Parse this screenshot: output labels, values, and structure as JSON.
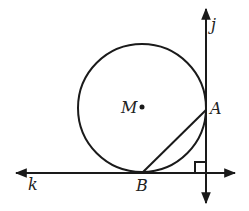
{
  "diagram": {
    "type": "geometry",
    "labels": {
      "center": "M",
      "point_a": "A",
      "point_b": "B",
      "line_vertical": "j",
      "line_horizontal": "k"
    },
    "relations": {
      "perpendicular": [
        "j",
        "k"
      ],
      "tangent_points": {
        "j": "A",
        "k": "B"
      },
      "segments": [
        [
          "A",
          "B"
        ]
      ]
    },
    "colors": {
      "stroke": "#1a1a1a",
      "background": "#ffffff"
    }
  }
}
